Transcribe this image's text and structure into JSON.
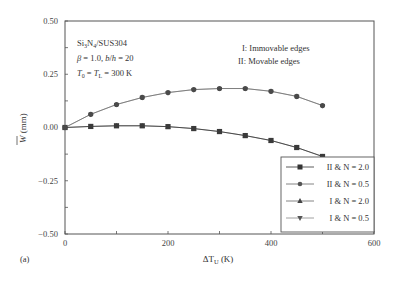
{
  "panel_label": "(a)",
  "annotations": {
    "material": "Si3N4/SUS304",
    "material_parts": {
      "a": "Si",
      "a_sub": "3",
      "b": "N",
      "b_sub": "4",
      "c": "/SUS304"
    },
    "params_line": "β = 1.0, b/h = 20",
    "temp_line": "T0 = TL = 300 K",
    "edge_I": "I: Immovable edges",
    "edge_II": "II: Movable edges"
  },
  "axes": {
    "xlabel": "ΔTU (K)",
    "ylabel": "W̄ (mm)",
    "x_ticks": [
      "0",
      "200",
      "400",
      "600"
    ],
    "y_ticks": [
      "0.50",
      "0.25",
      "0.00",
      "−0.25",
      "−0.50"
    ]
  },
  "legend": [
    {
      "label": "II & N = 2.0",
      "marker": "square"
    },
    {
      "label": "II & N = 0.5",
      "marker": "circle"
    },
    {
      "label": "I & N = 2.0",
      "marker": "triangle-up"
    },
    {
      "label": "I & N = 0.5",
      "marker": "triangle-down"
    }
  ],
  "colors": {
    "line": "#555555",
    "marker": "#3a3a3a",
    "axis": "#444444",
    "frame": "#555555"
  },
  "chart_data": {
    "type": "line",
    "title": "",
    "xlabel": "ΔT_U (K)",
    "ylabel": "W̄ (mm)",
    "xlim": [
      0,
      600
    ],
    "ylim": [
      -0.5,
      0.5
    ],
    "x_ticks": [
      0,
      200,
      400,
      600
    ],
    "y_ticks": [
      -0.5,
      -0.25,
      0.0,
      0.25,
      0.5
    ],
    "grid": false,
    "legend_position": "lower right",
    "x": [
      0,
      50,
      100,
      150,
      200,
      250,
      300,
      350,
      400,
      450,
      500
    ],
    "series": [
      {
        "name": "II & N = 2.0",
        "marker": "square",
        "values": [
          0.0,
          0.005,
          0.008,
          0.008,
          0.004,
          -0.005,
          -0.019,
          -0.038,
          -0.061,
          -0.094,
          -0.136
        ]
      },
      {
        "name": "II & N = 0.5",
        "marker": "circle",
        "values": [
          0.0,
          0.062,
          0.108,
          0.141,
          0.164,
          0.178,
          0.183,
          0.183,
          0.17,
          0.146,
          0.103
        ]
      },
      {
        "name": "I & N = 2.0",
        "marker": "triangle-up",
        "values": [
          0.0,
          0.005,
          0.008,
          0.008,
          0.004,
          -0.005,
          -0.019,
          -0.038,
          -0.061,
          -0.094,
          -0.136
        ]
      },
      {
        "name": "I & N = 0.5",
        "marker": "triangle-down",
        "values": [
          0.0,
          0.062,
          0.108,
          0.141,
          0.164,
          0.178,
          0.183,
          0.183,
          0.17,
          0.146,
          0.103
        ]
      }
    ],
    "annotations": [
      "Si3N4/SUS304",
      "β = 1.0, b/h = 20",
      "T0 = TL = 300 K",
      "I: Immovable edges",
      "II: Movable edges"
    ],
    "panel_label": "(a)"
  }
}
